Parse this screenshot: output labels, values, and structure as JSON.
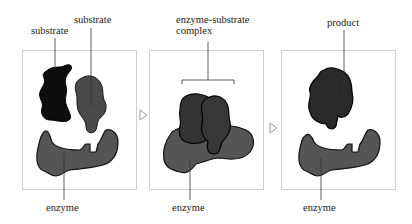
{
  "diagram": {
    "type": "enzyme-substrate mechanism",
    "panels": [
      {
        "id": "step-1",
        "labels": {
          "substrate_left": "substrate",
          "substrate_right": "substrate",
          "enzyme": "enzyme"
        }
      },
      {
        "id": "step-2",
        "labels": {
          "complex_line1": "enzyme-substrate",
          "complex_line2": "complex",
          "enzyme": "enzyme"
        }
      },
      {
        "id": "step-3",
        "labels": {
          "product": "product",
          "enzyme": "enzyme"
        }
      }
    ],
    "arrows": [
      "arrow-right",
      "arrow-right"
    ],
    "colors": {
      "substrate_dark": "#0d0d0d",
      "substrate_grey": "#4a4a4a",
      "enzyme": "#555555",
      "complex": "#333333",
      "product": "#2a2a2a",
      "panel_border": "#cfcfcf",
      "leader_line": "#333333"
    }
  }
}
